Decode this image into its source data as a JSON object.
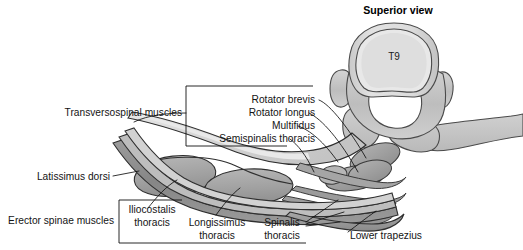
{
  "figure": {
    "title": "Superior view",
    "vertebra_label": "T9",
    "labels": {
      "transversospinal_group": "Transversospinal muscles",
      "rotator_brevis": "Rotator brevis",
      "rotator_longus": "Rotator longus",
      "multifidus": "Multifidus",
      "semispinalis_thoracis": "Semispinalis thoracis",
      "latissimus_dorsi": "Latissimus dorsi",
      "erector_spinae_group": "Erector spinae muscles",
      "iliocostalis_line1": "Iliocostalis",
      "iliocostalis_line2": "thoracis",
      "longissimus_line1": "Longissimus",
      "longissimus_line2": "thoracis",
      "spinalis_line1": "Spinalis",
      "spinalis_line2": "thoracis",
      "lower_trapezius": "Lower trapezius"
    },
    "colors": {
      "background": "#ffffff",
      "bone_light": "#dcdcdc",
      "bone_mid": "#c6c6c6",
      "bone_shadow": "#b2b2b2",
      "muscle_mid": "#a9a9a9",
      "muscle_dark": "#8f8f8f",
      "muscle_darker": "#7d7d7d",
      "aponeurosis": "#d2d2d2",
      "outline": "#3a3a3a",
      "text": "#111111"
    }
  }
}
